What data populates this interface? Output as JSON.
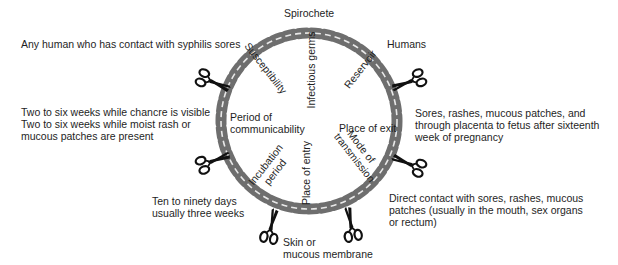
{
  "title": "Spirochete",
  "ring": {
    "chain_color": "#6e6e6e",
    "link_highlight_color": "#e8e8e8",
    "scissors_color": "#111111"
  },
  "links_in_chain": {
    "infectious_germs": "Infectious germs",
    "reservoir": "Reservoir",
    "place_of_exit": "Place of exit",
    "mode_of_transmission_line1": "Mode of",
    "mode_of_transmission_line2": "transmission",
    "place_of_entry": "Place of entry",
    "incubation_period_line1": "Incubation",
    "incubation_period_line2": "period",
    "period_of_communicability_line1": "Period of",
    "period_of_communicability_line2": "communicability",
    "susceptibility": "Susceptibility"
  },
  "outer_notes": {
    "susceptibility": "Any human who has  contact with syphilis sores",
    "reservoir": "Humans",
    "communicability_line1": "Two to six weeks while chancre is visible",
    "communicability_line2": "Two to six weeks while moist rash or",
    "communicability_line3": "mucous patches are present",
    "exit_line1": "Sores, rashes, mucous  patches, and",
    "exit_line2": "through  placenta to fetus after  sixteenth",
    "exit_line3": "week of  pregnancy",
    "incubation_line1": "Ten to ninety days",
    "incubation_line2": "usually three weeks",
    "transmission_line1": "Direct contact with  sores, rashes, mucous",
    "transmission_line2": "patches (usually in the mouth, sex organs",
    "transmission_line3": "or rectum)",
    "entry_line1": "Skin or",
    "entry_line2": "mucous membrane"
  },
  "scissors": [
    {
      "id": "scissors-susceptibility",
      "x": 205,
      "y": 80,
      "angle": 20
    },
    {
      "id": "scissors-reservoir",
      "x": 410,
      "y": 80,
      "angle": 160
    },
    {
      "id": "scissors-incubation",
      "x": 215,
      "y": 160,
      "angle": -20
    },
    {
      "id": "scissors-exit",
      "x": 400,
      "y": 165,
      "angle": 200
    },
    {
      "id": "scissors-entry",
      "x": 272,
      "y": 225,
      "angle": -75
    },
    {
      "id": "scissors-transmission",
      "x": 352,
      "y": 222,
      "angle": 255
    }
  ]
}
